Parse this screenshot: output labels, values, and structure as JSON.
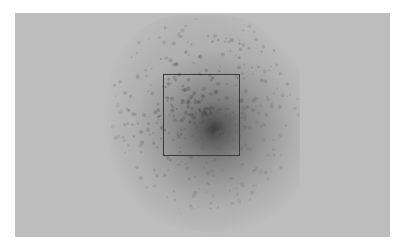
{
  "image": {
    "description": "Grayscale micrograph showing a dark diffuse spot with a square region-of-interest outline",
    "background_color": "#bdbdbd",
    "spot_color": "#3e3e3e",
    "roi_outline_color": "#3a3a3a"
  }
}
